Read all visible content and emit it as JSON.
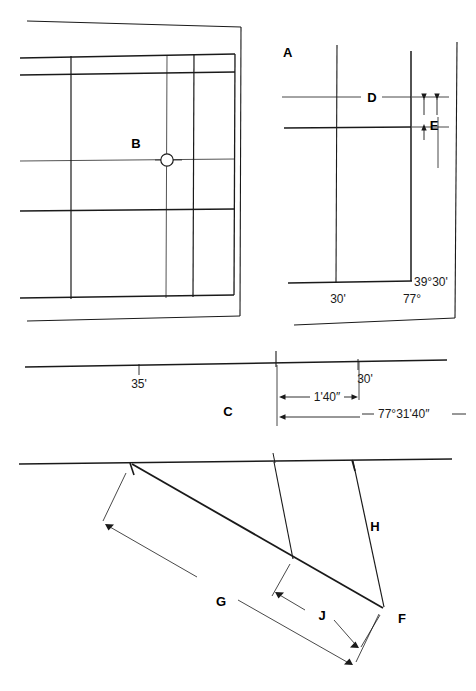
{
  "figure": {
    "background_color": "#ffffff",
    "line_color": "#1a1a1a",
    "panels": {
      "b": {
        "callout_label": "B",
        "center_mark": "circle-register-mark"
      },
      "a": {
        "callout_label": "A",
        "dimension_d_label": "D",
        "dimension_e_label": "E",
        "bottom_left_value": "30'",
        "bottom_right_value": "77°",
        "corner_value": "39°30'"
      },
      "c": {
        "callout_label": "C",
        "left_tick_value": "35'",
        "right_tick_value": "30'",
        "interval_value": "1'40″",
        "longitude_value": "77°31'40″"
      },
      "lower": {
        "dimension_g_label": "G",
        "dimension_h_label": "H",
        "dimension_j_label": "J",
        "vertex_f_label": "F"
      }
    }
  }
}
